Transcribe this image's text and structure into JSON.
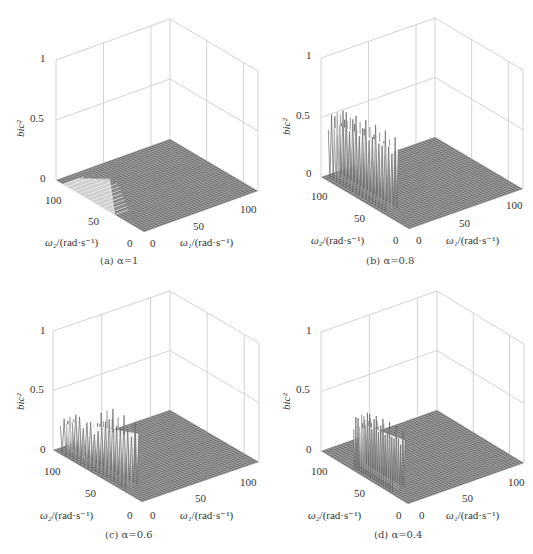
{
  "figure": {
    "panels": [
      {
        "id": "a",
        "caption": "(a) α=1",
        "alpha": 1.0
      },
      {
        "id": "b",
        "caption": "(b) α=0.8",
        "alpha": 0.8
      },
      {
        "id": "c",
        "caption": "(c) α=0.6",
        "alpha": 0.6
      },
      {
        "id": "d",
        "caption": "(d) α=0.4",
        "alpha": 0.4
      }
    ]
  },
  "axes": {
    "z_label": "bic²",
    "x_label_sym": "ω₁",
    "x_label_unit": "/(rad·s⁻¹)",
    "y_label_sym": "ω₂",
    "y_label_unit": "/(rad·s⁻¹)",
    "z_ticks": [
      "1",
      "0.5",
      "0"
    ],
    "x_ticks": [
      "0",
      "50",
      "100"
    ],
    "y_ticks": [
      "0",
      "50",
      "100"
    ]
  },
  "colors": {
    "box": "#c8c8c8",
    "mesh": "#555555",
    "mesh_light": "#e0e0e0",
    "peak": "#777777"
  },
  "chart_data": [
    {
      "type": "surface",
      "title": "(a) α=1",
      "xlabel": "ω1/(rad·s⁻¹)",
      "ylabel": "ω2/(rad·s⁻¹)",
      "zlabel": "bic²",
      "xlim": [
        0,
        120
      ],
      "ylim": [
        0,
        120
      ],
      "zlim": [
        0,
        1
      ],
      "x_ticks": [
        0,
        50,
        100
      ],
      "y_ticks": [
        0,
        50,
        100
      ],
      "z_ticks": [
        0,
        0.5,
        1
      ],
      "grid": true,
      "description": "Nearly flat surface at 0; low-amplitude (~0.02) light triangular patch region for ω1 0-40, ω2 40-110",
      "peak_region": {
        "w1": [
          0,
          40
        ],
        "w2": [
          40,
          110
        ],
        "max_bic2": 0.02
      }
    },
    {
      "type": "surface",
      "title": "(b) α=0.8",
      "xlabel": "ω1/(rad·s⁻¹)",
      "ylabel": "ω2/(rad·s⁻¹)",
      "zlabel": "bic²",
      "xlim": [
        0,
        120
      ],
      "ylim": [
        0,
        120
      ],
      "zlim": [
        0,
        1
      ],
      "x_ticks": [
        0,
        50,
        100
      ],
      "y_ticks": [
        0,
        50,
        100
      ],
      "z_ticks": [
        0,
        0.5,
        1
      ],
      "grid": true,
      "description": "Oscillating ridge of peaks near ω1≈0-10 across ω2≈30-110, peak bic² ≈0.6",
      "peak_region": {
        "w1": [
          0,
          12
        ],
        "w2": [
          30,
          110
        ],
        "max_bic2": 0.62
      }
    },
    {
      "type": "surface",
      "title": "(c) α=0.6",
      "xlabel": "ω1/(rad·s⁻¹)",
      "ylabel": "ω2/(rad·s⁻¹)",
      "zlabel": "bic²",
      "xlim": [
        0,
        120
      ],
      "ylim": [
        0,
        120
      ],
      "zlim": [
        0,
        1
      ],
      "x_ticks": [
        0,
        50,
        100
      ],
      "y_ticks": [
        0,
        50,
        100
      ],
      "z_ticks": [
        0,
        0.5,
        1
      ],
      "grid": true,
      "description": "Oscillating ridge of peaks near ω1≈0-10, two groups: ~0.35 at high ω2 and ~0.55 at lower ω2",
      "peak_region": {
        "w1": [
          0,
          12
        ],
        "w2": [
          20,
          110
        ],
        "max_bic2": 0.55
      }
    },
    {
      "type": "surface",
      "title": "(d) α=0.4",
      "xlabel": "ω1/(rad·s⁻¹)",
      "ylabel": "ω2/(rad·s⁻¹)",
      "zlabel": "bic²",
      "xlim": [
        0,
        120
      ],
      "ylim": [
        0,
        120
      ],
      "zlim": [
        0,
        1
      ],
      "x_ticks": [
        0,
        50,
        100
      ],
      "y_ticks": [
        0,
        50,
        100
      ],
      "z_ticks": [
        0,
        0.5,
        1
      ],
      "grid": true,
      "description": "Narrower oscillating ridge near ω1≈0-10, ω2≈20-70, peak bic² ≈0.5",
      "peak_region": {
        "w1": [
          0,
          12
        ],
        "w2": [
          20,
          75
        ],
        "max_bic2": 0.5
      }
    }
  ]
}
